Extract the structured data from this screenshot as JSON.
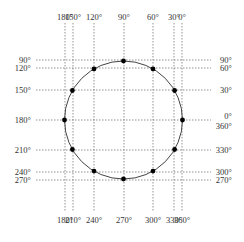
{
  "diagram": {
    "circle": {
      "cx": 123.5,
      "cy": 120,
      "r": 59
    },
    "top_labels": [
      {
        "text": "180°",
        "x": 65
      },
      {
        "text": "150°",
        "x": 73
      },
      {
        "text": "120°",
        "x": 94
      },
      {
        "text": "90°",
        "x": 124
      },
      {
        "text": "60°",
        "x": 153
      },
      {
        "text": "30°",
        "x": 174
      },
      {
        "text": "0°",
        "x": 182
      }
    ],
    "bottom_labels": [
      {
        "text": "180°",
        "x": 65
      },
      {
        "text": "210°",
        "x": 73
      },
      {
        "text": "240°",
        "x": 94
      },
      {
        "text": "270°",
        "x": 124
      },
      {
        "text": "300°",
        "x": 153
      },
      {
        "text": "330°",
        "x": 174
      },
      {
        "text": "360°",
        "x": 182
      }
    ],
    "left_labels": [
      {
        "text": "90°",
        "y": 60
      },
      {
        "text": "120°",
        "y": 68
      },
      {
        "text": "150°",
        "y": 90
      },
      {
        "text": "180°",
        "y": 120
      },
      {
        "text": "210°",
        "y": 150
      },
      {
        "text": "240°",
        "y": 172
      },
      {
        "text": "270°",
        "y": 180
      }
    ],
    "right_labels": [
      {
        "text": "90°",
        "y": 60
      },
      {
        "text": "60°",
        "y": 68
      },
      {
        "text": "30°",
        "y": 90
      },
      {
        "text": "0°",
        "y": 116
      },
      {
        "text": "360°",
        "y": 126
      },
      {
        "text": "330°",
        "y": 150
      },
      {
        "text": "300°",
        "y": 172
      },
      {
        "text": "270°",
        "y": 180
      }
    ],
    "points_deg": [
      0,
      30,
      60,
      90,
      120,
      150,
      180,
      210,
      240,
      270,
      300,
      330
    ]
  }
}
